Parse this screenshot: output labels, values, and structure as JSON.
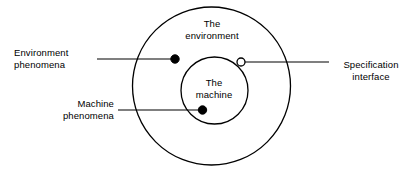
{
  "diagram": {
    "type": "concentric-circles-annotated",
    "background_color": "#ffffff",
    "stroke_color": "#000000",
    "regions": {
      "outer": {
        "label_line1": "The",
        "label_line2": "environment",
        "shape": "circle"
      },
      "inner": {
        "label_line1": "The",
        "label_line2": "machine",
        "shape": "circle"
      }
    },
    "annotations": [
      {
        "name": "environment-phenomena",
        "label_line1": "Environment",
        "label_line2": "phenomena",
        "marker": "filled-dot",
        "marker_color": "#000000",
        "align": "left"
      },
      {
        "name": "machine-phenomena",
        "label_line1": "Machine",
        "label_line2": "phenomena",
        "marker": "filled-dot",
        "marker_color": "#000000",
        "align": "right"
      },
      {
        "name": "specification-interface",
        "label_line1": "Specification",
        "label_line2": "interface",
        "marker": "hollow-dot",
        "marker_color": "#ffffff",
        "align": "center"
      }
    ]
  }
}
